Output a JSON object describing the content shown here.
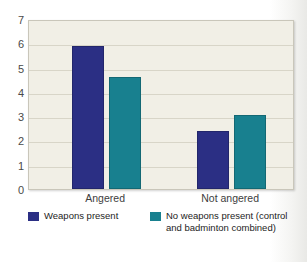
{
  "chart_data": {
    "type": "bar",
    "title": "",
    "xlabel": "",
    "ylabel": "",
    "categories": [
      "Angered",
      "Not angered"
    ],
    "series": [
      {
        "name": "Weapons present",
        "values": [
          5.9,
          2.4
        ],
        "color": "#2b2f84"
      },
      {
        "name": "No weapons present (control and badminton combined)",
        "values": [
          4.6,
          3.05
        ],
        "color": "#18808f"
      }
    ],
    "ylim": [
      0,
      7
    ],
    "yticks": [
      0,
      1,
      2,
      3,
      4,
      5,
      6,
      7
    ],
    "ytick_labels": [
      "0",
      "1",
      "2",
      "3",
      "4",
      "5",
      "6",
      "7"
    ],
    "grid": true,
    "legend_position": "bottom"
  },
  "legend": {
    "entries": [
      {
        "label": "Weapons present",
        "color": "#2b2f84"
      },
      {
        "label": "No weapons present (control and badminton combined)",
        "color": "#18808f"
      }
    ]
  },
  "colors": {
    "series_0": "#2b2f84",
    "series_1": "#18808f",
    "plot_background": "#f1efe6",
    "gridline": "#d8d5c8",
    "page_background": "#ffffff"
  }
}
